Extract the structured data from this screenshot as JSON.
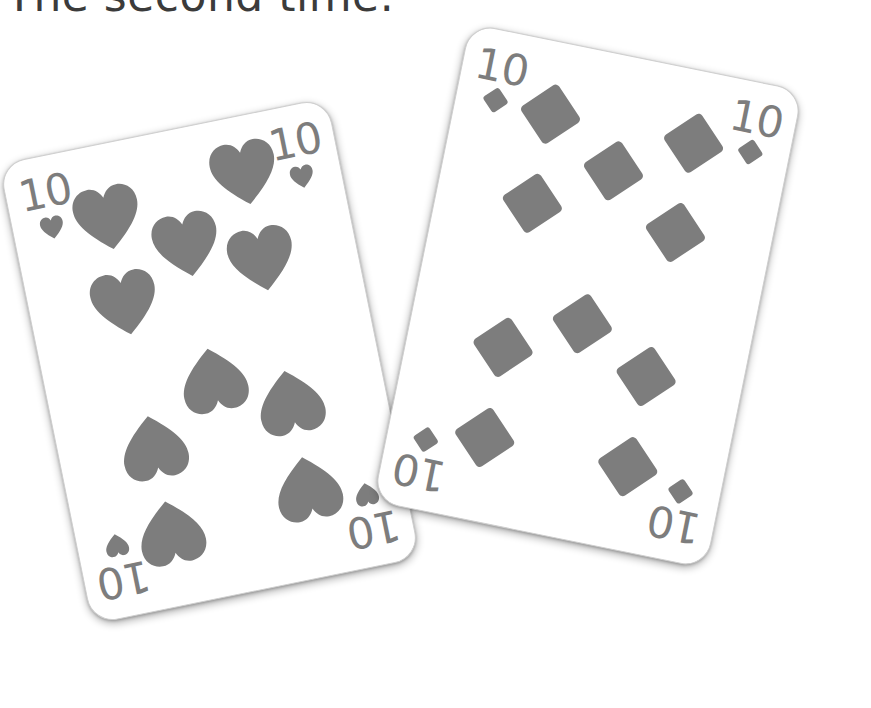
{
  "scene": {
    "description": "Two gray playing cards on a white background, overlapping and slightly rotated",
    "background_color": "#ffffff",
    "ink_color": "#7d7d7d",
    "caption_color": "#3b3b3b"
  },
  "caption": {
    "text": "The second time.",
    "note": "cropped at top edge of image"
  },
  "cards": [
    {
      "id": "card-hearts",
      "rank": "10",
      "suit": "hearts",
      "suit_symbol": "♥",
      "pip_count": 10,
      "rotation_deg": -11.5,
      "z_order": 1,
      "corners": [
        {
          "position": "top-left",
          "rank": "10",
          "suit_symbol": "♥",
          "inverted": false
        },
        {
          "position": "top-right",
          "rank": "10",
          "suit_symbol": "♥",
          "inverted": false
        },
        {
          "position": "bottom-left",
          "rank": "10",
          "suit_symbol": "♥",
          "inverted": true
        },
        {
          "position": "bottom-right",
          "rank": "10",
          "suit_symbol": "♥",
          "inverted": true
        }
      ],
      "pips": [
        {
          "x": 16,
          "y": 12,
          "flipped": false
        },
        {
          "x": 84,
          "y": 8,
          "flipped": false
        },
        {
          "x": 16,
          "y": 33,
          "flipped": false
        },
        {
          "x": 84,
          "y": 29,
          "flipped": false
        },
        {
          "x": 50,
          "y": 22,
          "flipped": false
        },
        {
          "x": 50,
          "y": 55,
          "flipped": true
        },
        {
          "x": 16,
          "y": 68,
          "flipped": true
        },
        {
          "x": 84,
          "y": 64,
          "flipped": true
        },
        {
          "x": 16,
          "y": 89,
          "flipped": true
        },
        {
          "x": 84,
          "y": 85,
          "flipped": true
        }
      ]
    },
    {
      "id": "card-diamonds",
      "rank": "10",
      "suit": "diamonds",
      "suit_symbol": "♦",
      "pip_count": 10,
      "rotation_deg": 11.5,
      "z_order": 2,
      "corners": [
        {
          "position": "top-left",
          "rank": "10",
          "suit_symbol": "♦",
          "inverted": false
        },
        {
          "position": "top-right",
          "rank": "10",
          "suit_symbol": "♦",
          "inverted": false
        },
        {
          "position": "bottom-left",
          "rank": "10",
          "suit_symbol": "♦",
          "inverted": true
        },
        {
          "position": "bottom-right",
          "rank": "10",
          "suit_symbol": "♦",
          "inverted": true
        }
      ],
      "pips": [
        {
          "x": 16,
          "y": 11,
          "flipped": false
        },
        {
          "x": 84,
          "y": 11,
          "flipped": false
        },
        {
          "x": 16,
          "y": 32,
          "flipped": false
        },
        {
          "x": 84,
          "y": 32,
          "flipped": false
        },
        {
          "x": 50,
          "y": 21,
          "flipped": false
        },
        {
          "x": 50,
          "y": 57,
          "flipped": false
        },
        {
          "x": 16,
          "y": 66,
          "flipped": false
        },
        {
          "x": 84,
          "y": 66,
          "flipped": false
        },
        {
          "x": 16,
          "y": 87,
          "flipped": false
        },
        {
          "x": 84,
          "y": 87,
          "flipped": false
        }
      ]
    }
  ]
}
